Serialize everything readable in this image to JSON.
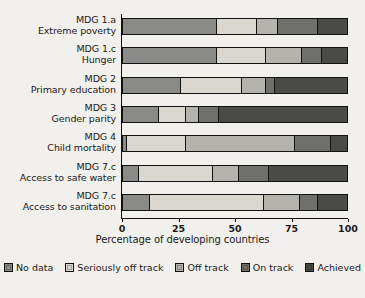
{
  "chart_data": {
    "type": "bar",
    "orientation": "horizontal",
    "stacked": true,
    "title": "",
    "xlabel": "Percentage of developing countries",
    "ylabel": "",
    "xlim": [
      0,
      100
    ],
    "xticks": [
      0,
      25,
      50,
      75,
      100
    ],
    "xticklabels": [
      "0",
      "25",
      "50",
      "75",
      "100"
    ],
    "grid": false,
    "legend_position": "bottom",
    "categories": [
      {
        "line1": "MDG 1.a",
        "line2": "Extreme poverty"
      },
      {
        "line1": "MDG 1.c",
        "line2": "Hunger"
      },
      {
        "line1": "MDG 2",
        "line2": "Primary education"
      },
      {
        "line1": "MDG 3",
        "line2": "Gender parity"
      },
      {
        "line1": "MDG 4",
        "line2": "Child mortality"
      },
      {
        "line1": "MDG 7.c",
        "line2": "Access to safe water"
      },
      {
        "line1": "MDG 7.c",
        "line2": "Access to sanitation"
      }
    ],
    "series": [
      {
        "name": "No data",
        "color": "#8a8a86",
        "values": [
          42,
          42,
          26,
          16,
          2,
          7,
          12
        ]
      },
      {
        "name": "Seriously off track",
        "color": "#d9d7d0",
        "values": [
          18,
          22,
          27,
          12,
          26,
          33,
          51
        ]
      },
      {
        "name": "Off track",
        "color": "#b4b2ac",
        "values": [
          9,
          16,
          11,
          6,
          49,
          12,
          16
        ]
      },
      {
        "name": "On track",
        "color": "#6f6f6b",
        "values": [
          18,
          9,
          4,
          9,
          16,
          13,
          8
        ]
      },
      {
        "name": "Achieved",
        "color": "#4a4a47",
        "values": [
          13,
          11,
          32,
          57,
          7,
          35,
          13
        ]
      }
    ]
  },
  "legend": {
    "items": [
      {
        "label": "No data",
        "color": "#8a8a86"
      },
      {
        "label": "Seriously off track",
        "color": "#d9d7d0"
      },
      {
        "label": "Off track",
        "color": "#b4b2ac"
      },
      {
        "label": "On track",
        "color": "#6f6f6b"
      },
      {
        "label": "Achieved",
        "color": "#4a4a47"
      }
    ]
  }
}
